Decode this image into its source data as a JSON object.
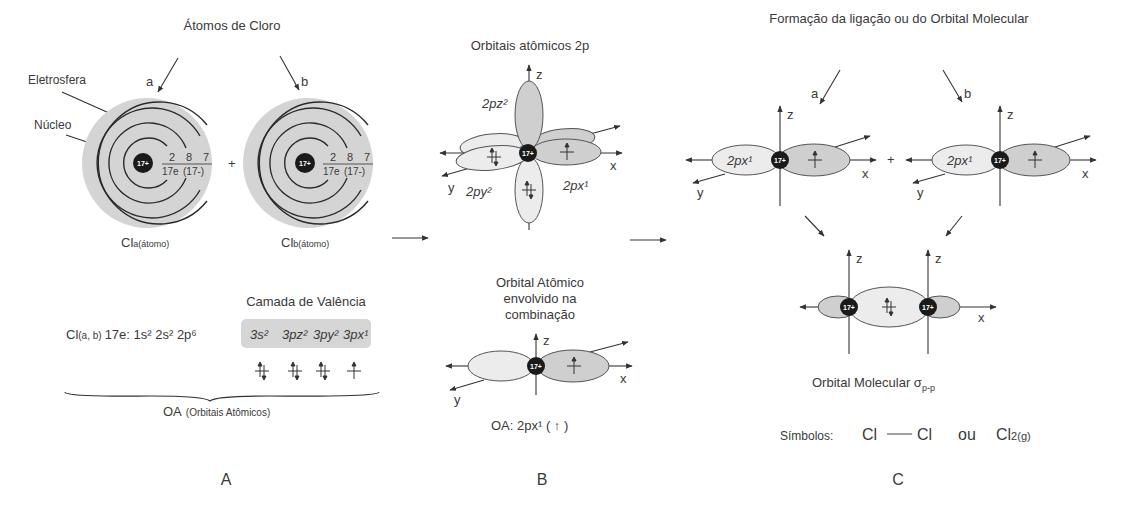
{
  "panelA": {
    "title": "Átomos de Cloro",
    "atom_a_label": "a",
    "atom_b_label": "b",
    "eletrosfera_label": "Eletrosfera",
    "nucleo_label": "Núcleo",
    "nucleus_charge": "17+",
    "shells": [
      "2",
      "8",
      "7"
    ],
    "electrons_total": "17e",
    "electrons_charge": "(17-)",
    "plus": "+",
    "cl_a_main": "Cl",
    "cl_a_sub": "a(átomo)",
    "cl_b_main": "Cl",
    "cl_b_sub": "b(átomo)",
    "valence_title": "Camada de Valência",
    "config_prefix_main": "Cl",
    "config_prefix_sub": "(a, b)",
    "config_core": "17e: 1s² 2s² 2p⁶",
    "config_valence": [
      "3s²",
      "3pz²",
      "3py²",
      "3px¹"
    ],
    "oa_main": "OA",
    "oa_sub": "(Orbitais Atômicos)",
    "panel_label": "A"
  },
  "panelB": {
    "title": "Orbitais atômicos 2p",
    "axis_z": "z",
    "axis_x": "x",
    "axis_y": "y",
    "label_pz": "2pz²",
    "label_py": "2py²",
    "label_px": "2px¹",
    "nucleus_charge": "17+",
    "subtitle_lines": [
      "Orbital Atômico",
      "envolvido na",
      "combinação"
    ],
    "oa_text": "OA:  2px¹  ( ↑ )",
    "panel_label": "B"
  },
  "panelC": {
    "title": "Formação da ligação ou do Orbital Molecular",
    "atom_a_label": "a",
    "atom_b_label": "b",
    "orbital_label": "2px¹",
    "axis_z": "z",
    "axis_x": "x",
    "axis_y": "y",
    "plus": "+",
    "nucleus_charge": "17+",
    "mo_label": "Orbital Molecular σ",
    "mo_sub": "p-p",
    "symbols_label": "Símbolos:",
    "symbol_cl1": "Cl",
    "symbol_cl2": "Cl",
    "symbol_or": "ou",
    "symbol_cl2g_main": "Cl",
    "symbol_cl2g_sub": "2(g)",
    "panel_label": "C"
  },
  "colors": {
    "electrosphere": "#d4d4d4",
    "lobe_light": "#ececec",
    "lobe_dark": "#cfcfcf",
    "nucleus": "#1a1a1a",
    "valence_box": "#d6d6d6"
  }
}
